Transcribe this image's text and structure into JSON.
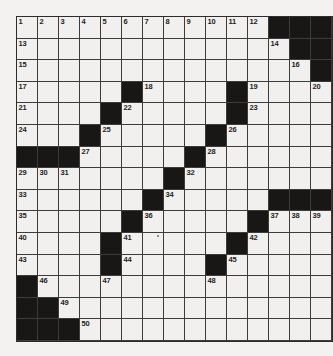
{
  "page": {
    "background": "#f4f2f0"
  },
  "puzzle": {
    "rows": 15,
    "cols": 15,
    "colors": {
      "cell_bg": "#f2f0ee",
      "black_cell": "#191715",
      "line": "#3c3c3c",
      "border": "#2c2c2c",
      "number": "#1d1d1d"
    },
    "pattern": [
      "............###",
      ".............##",
      "..............#",
      ".....#....#....",
      "....#.....#....",
      "...#.....#.....",
      "###.....#......",
      ".......#.......",
      "......#.....###",
      ".....#.....#...",
      "....#.....#....",
      "....#....#.....",
      "#..............",
      "##.............",
      "###............"
    ],
    "numbers": [
      {
        "n": "1",
        "row": 1,
        "col": 1
      },
      {
        "n": "2",
        "row": 1,
        "col": 2
      },
      {
        "n": "3",
        "row": 1,
        "col": 3
      },
      {
        "n": "4",
        "row": 1,
        "col": 4
      },
      {
        "n": "5",
        "row": 1,
        "col": 5
      },
      {
        "n": "6",
        "row": 1,
        "col": 6
      },
      {
        "n": "7",
        "row": 1,
        "col": 7
      },
      {
        "n": "8",
        "row": 1,
        "col": 8
      },
      {
        "n": "9",
        "row": 1,
        "col": 9
      },
      {
        "n": "10",
        "row": 1,
        "col": 10
      },
      {
        "n": "11",
        "row": 1,
        "col": 11
      },
      {
        "n": "12",
        "row": 1,
        "col": 12
      },
      {
        "n": "13",
        "row": 2,
        "col": 1
      },
      {
        "n": "14",
        "row": 2,
        "col": 13
      },
      {
        "n": "15",
        "row": 3,
        "col": 1
      },
      {
        "n": "16",
        "row": 3,
        "col": 14
      },
      {
        "n": "17",
        "row": 4,
        "col": 1
      },
      {
        "n": "18",
        "row": 4,
        "col": 7
      },
      {
        "n": "19",
        "row": 4,
        "col": 12
      },
      {
        "n": "20",
        "row": 4,
        "col": 15
      },
      {
        "n": "21",
        "row": 5,
        "col": 1
      },
      {
        "n": "22",
        "row": 5,
        "col": 6
      },
      {
        "n": "23",
        "row": 5,
        "col": 12
      },
      {
        "n": "24",
        "row": 6,
        "col": 1
      },
      {
        "n": "25",
        "row": 6,
        "col": 5
      },
      {
        "n": "26",
        "row": 6,
        "col": 11
      },
      {
        "n": "27",
        "row": 7,
        "col": 4
      },
      {
        "n": "28",
        "row": 7,
        "col": 10
      },
      {
        "n": "29",
        "row": 8,
        "col": 1
      },
      {
        "n": "30",
        "row": 8,
        "col": 2
      },
      {
        "n": "31",
        "row": 8,
        "col": 3
      },
      {
        "n": "32",
        "row": 8,
        "col": 9
      },
      {
        "n": "33",
        "row": 9,
        "col": 1
      },
      {
        "n": "34",
        "row": 9,
        "col": 8
      },
      {
        "n": "35",
        "row": 10,
        "col": 1
      },
      {
        "n": "36",
        "row": 10,
        "col": 7
      },
      {
        "n": "37",
        "row": 10,
        "col": 13
      },
      {
        "n": "38",
        "row": 10,
        "col": 14
      },
      {
        "n": "39",
        "row": 10,
        "col": 15
      },
      {
        "n": "40",
        "row": 11,
        "col": 1
      },
      {
        "n": "41",
        "row": 11,
        "col": 6
      },
      {
        "n": "42",
        "row": 11,
        "col": 12
      },
      {
        "n": "43",
        "row": 12,
        "col": 1
      },
      {
        "n": "44",
        "row": 12,
        "col": 6
      },
      {
        "n": "45",
        "row": 12,
        "col": 11
      },
      {
        "n": "46",
        "row": 13,
        "col": 2
      },
      {
        "n": "47",
        "row": 13,
        "col": 5
      },
      {
        "n": "48",
        "row": 13,
        "col": 10
      },
      {
        "n": "49",
        "row": 14,
        "col": 3
      },
      {
        "n": "50",
        "row": 15,
        "col": 4
      }
    ]
  }
}
